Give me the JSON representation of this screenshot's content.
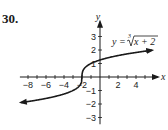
{
  "problem": {
    "number": "30."
  },
  "chart_data": {
    "type": "line",
    "title": "",
    "function": "y = cbrt(x + 2)",
    "equation_label": {
      "lhs": "y =",
      "index": "3",
      "radicand": "x + 2"
    },
    "xlabel": "x",
    "ylabel": "y",
    "xlim": [
      -9,
      6
    ],
    "ylim": [
      -3.5,
      3.8
    ],
    "x_ticks": [
      -8,
      -6,
      -4,
      -2,
      2,
      4
    ],
    "x_tick_labels": [
      "−8",
      "−6",
      "−4",
      "−2",
      "2",
      "4"
    ],
    "y_ticks": [
      -3,
      -2,
      -1,
      1,
      2,
      3
    ],
    "y_tick_labels": [
      "−3",
      "−2",
      "−1",
      "1",
      "2",
      "3"
    ],
    "series": [
      {
        "name": "y = ∛(x+2)",
        "x": [
          -8.8,
          -8,
          -6,
          -4,
          -3,
          -2.5,
          -2,
          -1.5,
          -1,
          0,
          2,
          4,
          5.8
        ],
        "y": [
          -1.9,
          -1.82,
          -1.59,
          -1.26,
          -1,
          -0.79,
          0,
          0.79,
          1,
          1.26,
          1.59,
          1.82,
          1.99
        ]
      }
    ],
    "arrows_on_both_ends": true,
    "grid": false,
    "legend": "none"
  },
  "colors": {
    "ink": "#1a1a1a",
    "background": "#ffffff"
  }
}
